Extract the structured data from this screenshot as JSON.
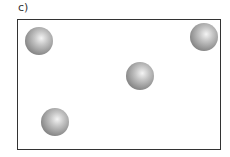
{
  "figure": {
    "label": "c)",
    "box": {
      "x": 17,
      "y": 19,
      "w": 204,
      "h": 131,
      "border_color": "#333333"
    },
    "spheres": [
      {
        "cx": 39,
        "cy": 41,
        "r": 14
      },
      {
        "cx": 204,
        "cy": 37,
        "r": 14
      },
      {
        "cx": 140,
        "cy": 76,
        "r": 14
      },
      {
        "cx": 55,
        "cy": 122,
        "r": 14
      }
    ]
  }
}
